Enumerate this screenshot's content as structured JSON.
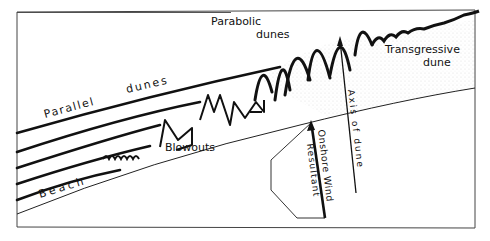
{
  "diagram": {
    "type": "coastal-dune-landforms",
    "labels": {
      "parallel": "Parallel",
      "dunes": "dunes",
      "parabolic": "Parabolic",
      "parabolic_dunes": "dunes",
      "transgressive": "Transgressive",
      "transgressive_dune": "dune",
      "blowouts": "Blowouts",
      "beach": "Beach",
      "axis_of_dune": "Axis of dune",
      "onshore_wind": "Onshore Wind",
      "resultant": "Resultant"
    },
    "colors": {
      "ink": "#111111",
      "background": "#ffffff",
      "stipple": "#d8d8d8"
    }
  }
}
